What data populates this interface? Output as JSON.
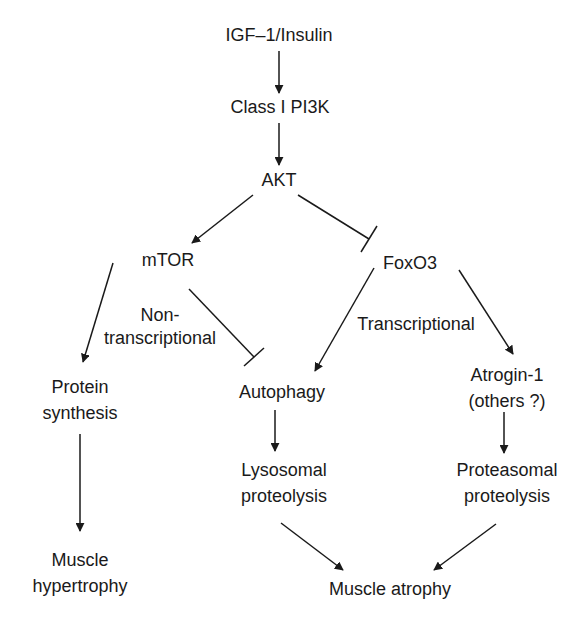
{
  "diagram": {
    "type": "signaling-pathway",
    "nodes": {
      "igf": {
        "line1": "IGF–1/Insulin"
      },
      "pi3k": {
        "line1": "Class I PI3K"
      },
      "akt": {
        "line1": "AKT"
      },
      "mtor": {
        "line1": "mTOR"
      },
      "foxo3": {
        "line1": "FoxO3"
      },
      "protein_synthesis": {
        "line1": "Protein",
        "line2": "synthesis"
      },
      "autophagy": {
        "line1": "Autophagy"
      },
      "atrogin": {
        "line1": "Atrogin-1",
        "line2": "(others ?)"
      },
      "hypertrophy": {
        "line1": "Muscle",
        "line2": "hypertrophy"
      },
      "lysosomal": {
        "line1": "Lysosomal",
        "line2": "proteolysis"
      },
      "proteasomal": {
        "line1": "Proteasomal",
        "line2": "proteolysis"
      },
      "atrophy": {
        "line1": "Muscle atrophy"
      }
    },
    "edge_labels": {
      "non_transcriptional": {
        "line1": "Non-",
        "line2": "transcriptional"
      },
      "transcriptional": {
        "line1": "Transcriptional"
      }
    },
    "edges": [
      {
        "from": "IGF–1/Insulin",
        "to": "Class I PI3K",
        "type": "activates"
      },
      {
        "from": "Class I PI3K",
        "to": "AKT",
        "type": "activates"
      },
      {
        "from": "AKT",
        "to": "mTOR",
        "type": "activates"
      },
      {
        "from": "AKT",
        "to": "FoxO3",
        "type": "inhibits"
      },
      {
        "from": "mTOR",
        "to": "Protein synthesis",
        "type": "activates"
      },
      {
        "from": "mTOR",
        "to": "Autophagy",
        "type": "inhibits",
        "label": "Non-transcriptional"
      },
      {
        "from": "FoxO3",
        "to": "Autophagy",
        "type": "activates",
        "label": "Transcriptional"
      },
      {
        "from": "FoxO3",
        "to": "Atrogin-1 (others ?)",
        "type": "activates"
      },
      {
        "from": "Protein synthesis",
        "to": "Muscle hypertrophy",
        "type": "activates"
      },
      {
        "from": "Autophagy",
        "to": "Lysosomal proteolysis",
        "type": "activates"
      },
      {
        "from": "Atrogin-1 (others ?)",
        "to": "Proteasomal proteolysis",
        "type": "activates"
      },
      {
        "from": "Lysosomal proteolysis",
        "to": "Muscle atrophy",
        "type": "activates"
      },
      {
        "from": "Proteasomal proteolysis",
        "to": "Muscle atrophy",
        "type": "activates"
      }
    ],
    "colors": {
      "line": "#1a1a1a",
      "background": "#ffffff"
    }
  }
}
